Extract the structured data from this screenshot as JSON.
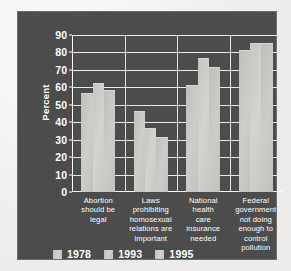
{
  "chart_data": {
    "type": "bar",
    "title": "",
    "xlabel": "",
    "ylabel": "Percent",
    "ylim": [
      0,
      90
    ],
    "yticks": [
      0,
      10,
      20,
      30,
      40,
      50,
      60,
      70,
      80,
      90
    ],
    "grid": true,
    "legend_position": "bottom-left",
    "categories": [
      "Abortion should be legal",
      "Laws prohibiting homosexual relations are important",
      "National health care insurance needed",
      "Federal government not doing enough to control pollution"
    ],
    "category_lines": [
      [
        "Abortion",
        "should be",
        "legal"
      ],
      [
        "Laws",
        "prohibiting",
        "homosexual",
        "relations are",
        "important"
      ],
      [
        "National",
        "health",
        "care",
        "insurance",
        "needed"
      ],
      [
        "Federal",
        "government",
        "not doing",
        "enough to",
        "control",
        "pollution"
      ]
    ],
    "series": [
      {
        "name": "1978",
        "values": [
          56,
          46,
          61,
          81
        ]
      },
      {
        "name": "1993",
        "values": [
          62,
          36,
          76,
          85
        ]
      },
      {
        "name": "1995",
        "values": [
          58,
          31,
          71,
          85
        ]
      }
    ]
  },
  "colors": {
    "panel_background": "#4a4a4a",
    "page_background": "#f1efec",
    "bar_fill": "#c9c8c4",
    "gridline": "#e9e9e9",
    "axis": "#ffffff",
    "text": "#ffffff"
  }
}
